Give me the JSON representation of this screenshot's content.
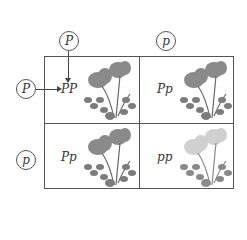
{
  "diagram": {
    "type": "punnett-square",
    "parents": {
      "top": [
        {
          "allele": "P"
        },
        {
          "allele": "p"
        }
      ],
      "left": [
        {
          "allele": "P"
        },
        {
          "allele": "p"
        }
      ]
    },
    "cells": [
      {
        "row": 0,
        "col": 0,
        "genotype": "PP",
        "flower": "dark"
      },
      {
        "row": 0,
        "col": 1,
        "genotype": "Pp",
        "flower": "dark"
      },
      {
        "row": 1,
        "col": 0,
        "genotype": "Pp",
        "flower": "dark"
      },
      {
        "row": 1,
        "col": 1,
        "genotype": "pp",
        "flower": "pale"
      }
    ],
    "colors": {
      "dark_petal": "#8a8a8a",
      "pale_petal": "#d0d0d0",
      "leaf": "#7c7c7c",
      "line": "#555555"
    }
  }
}
